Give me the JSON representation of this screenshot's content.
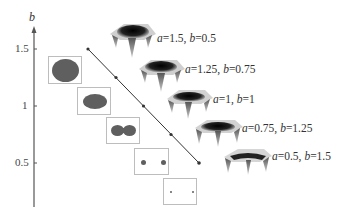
{
  "figure": {
    "axis": {
      "title": "b",
      "ticks": [
        {
          "label": "1.5",
          "value": 1.5
        },
        {
          "label": "1",
          "value": 1
        },
        {
          "label": "0.5",
          "value": 0.5
        }
      ]
    },
    "path": {
      "points": [
        {
          "a": 1.5,
          "b": 0.5
        },
        {
          "a": 1.25,
          "b": 0.75
        },
        {
          "a": 1,
          "b": 1
        },
        {
          "a": 0.75,
          "b": 1.25
        },
        {
          "a": 0.5,
          "b": 1.5
        }
      ]
    },
    "surfaces": [
      {
        "a_label": "a",
        "a_value": "=1.5, ",
        "b_label": "b",
        "b_value": "=0.5"
      },
      {
        "a_label": "a",
        "a_value": "=1.25, ",
        "b_label": "b",
        "b_value": "=0.75"
      },
      {
        "a_label": "a",
        "a_value": "=1, ",
        "b_label": "b",
        "b_value": "=1"
      },
      {
        "a_label": "a",
        "a_value": "=0.75, ",
        "b_label": "b",
        "b_value": "=1.25"
      },
      {
        "a_label": "a",
        "a_value": "=0.5, ",
        "b_label": "b",
        "b_value": "=1.5"
      }
    ],
    "insets": [
      {
        "shape": "large-disc"
      },
      {
        "shape": "ellipse"
      },
      {
        "shape": "dumbbell"
      },
      {
        "shape": "two-dots"
      },
      {
        "shape": "two-small-dots"
      }
    ],
    "colors": {
      "axis": "#555555",
      "line": "#333333",
      "blob": "#5f5f5f",
      "inset_border": "#bdbdbd"
    }
  }
}
